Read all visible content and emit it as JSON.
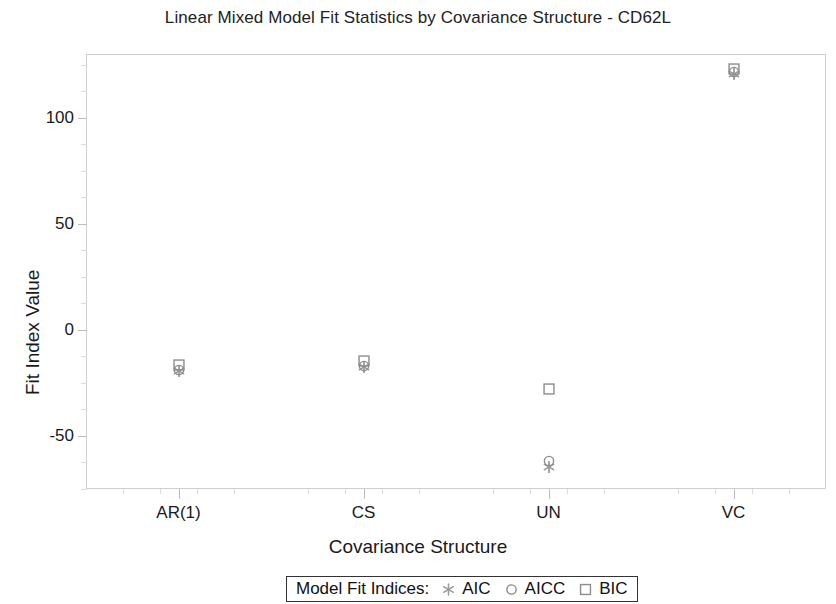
{
  "chart_data": {
    "type": "scatter",
    "title": "Linear Mixed Model Fit Statistics by Covariance Structure - CD62L",
    "xlabel": "Covariance Structure",
    "ylabel": "Fit Index Value",
    "categories": [
      "AR(1)",
      "CS",
      "UN",
      "VC"
    ],
    "series": [
      {
        "name": "AIC",
        "marker": "asterisk",
        "color": "#9a9a9a",
        "values": [
          -19.5,
          -17.5,
          -64.5,
          120.5
        ]
      },
      {
        "name": "AICC",
        "marker": "circle",
        "color": "#8c8c8c",
        "values": [
          -19.0,
          -17.0,
          -62.0,
          121.5
        ]
      },
      {
        "name": "BIC",
        "marker": "square",
        "color": "#8c8c8c",
        "values": [
          -16.5,
          -14.5,
          -28.0,
          123.0
        ]
      }
    ],
    "ylim": [
      -75,
      130
    ],
    "yticks": [
      -50,
      0,
      50,
      100
    ],
    "ytick_labels": [
      "-50",
      "0",
      "50",
      "100"
    ],
    "y_minor_ticks": [
      -75,
      -62.5,
      -37.5,
      -25,
      -12.5,
      12.5,
      25,
      37.5,
      62.5,
      75,
      87.5,
      112.5,
      125
    ],
    "grid": false,
    "legend": {
      "position": "bottom",
      "title": "Model Fit Indices:",
      "entries": [
        {
          "label": "AIC",
          "symbol": "asterisk"
        },
        {
          "label": "AICC",
          "symbol": "circle"
        },
        {
          "label": "BIC",
          "symbol": "square"
        }
      ]
    }
  },
  "colors": {
    "marker_gray": "#8c8c8c",
    "asterisk_gray": "#9a9a9a",
    "frame_gray": "#cfcfcf",
    "text": "#1a1a1a"
  }
}
